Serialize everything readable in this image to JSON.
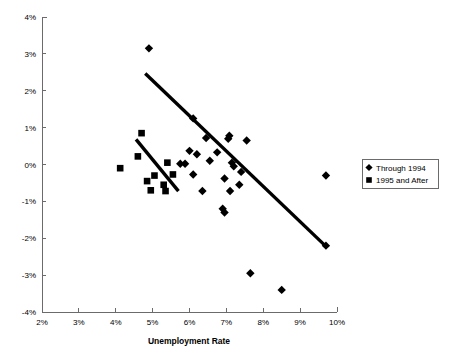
{
  "chart_data": {
    "type": "scatter",
    "title": "",
    "subtitle": "",
    "xlabel": "Unemployment Rate",
    "ylabel": "",
    "xlim": [
      2,
      10
    ],
    "ylim": [
      -4,
      4
    ],
    "xticks": [
      2,
      3,
      4,
      5,
      6,
      7,
      8,
      9,
      10
    ],
    "yticks": [
      -4,
      -3,
      -2,
      -1,
      0,
      1,
      2,
      3,
      4
    ],
    "xtick_labels": [
      "2%",
      "3%",
      "4%",
      "5%",
      "6%",
      "7%",
      "8%",
      "9%",
      "10%"
    ],
    "ytick_labels": [
      "-4%",
      "-3%",
      "-2%",
      "-1%",
      "0%",
      "1%",
      "2%",
      "3%",
      "4%"
    ],
    "grid": false,
    "legend_position": "right",
    "legend": [
      {
        "label": "Through 1994",
        "marker": "diamond",
        "color": "#000000"
      },
      {
        "label": "1995 and After",
        "marker": "square",
        "color": "#000000"
      }
    ],
    "series": [
      {
        "name": "Through 1994",
        "marker": "diamond",
        "color": "#000000",
        "points": [
          [
            4.9,
            3.15
          ],
          [
            6.1,
            1.25
          ],
          [
            6.45,
            0.72
          ],
          [
            6.0,
            0.37
          ],
          [
            6.2,
            0.28
          ],
          [
            5.75,
            0.02
          ],
          [
            5.88,
            0.02
          ],
          [
            6.75,
            0.33
          ],
          [
            6.55,
            0.1
          ],
          [
            6.1,
            -0.27
          ],
          [
            6.35,
            -0.72
          ],
          [
            7.05,
            0.7
          ],
          [
            7.08,
            0.78
          ],
          [
            7.55,
            0.65
          ],
          [
            7.15,
            0.05
          ],
          [
            7.2,
            -0.05
          ],
          [
            7.4,
            -0.2
          ],
          [
            6.95,
            -0.38
          ],
          [
            7.35,
            -0.55
          ],
          [
            7.1,
            -0.72
          ],
          [
            6.9,
            -1.2
          ],
          [
            6.95,
            -1.3
          ],
          [
            7.65,
            -2.95
          ],
          [
            8.5,
            -3.4
          ],
          [
            9.7,
            -0.3
          ],
          [
            9.7,
            -2.2
          ]
        ]
      },
      {
        "name": "1995 and After",
        "marker": "square",
        "color": "#000000",
        "points": [
          [
            4.7,
            0.85
          ],
          [
            4.12,
            -0.1
          ],
          [
            4.6,
            0.22
          ],
          [
            5.4,
            0.05
          ],
          [
            4.85,
            -0.45
          ],
          [
            5.05,
            -0.3
          ],
          [
            5.55,
            -0.27
          ],
          [
            5.3,
            -0.55
          ],
          [
            4.95,
            -0.7
          ],
          [
            5.35,
            -0.72
          ]
        ]
      }
    ],
    "trendlines": [
      {
        "name": "Through 1994 trend",
        "x1": 4.8,
        "y1": 2.47,
        "x2": 9.7,
        "y2": -2.22,
        "color": "#000000"
      },
      {
        "name": "1995 and After trend",
        "x1": 4.55,
        "y1": 0.68,
        "x2": 5.7,
        "y2": -0.72,
        "color": "#000000"
      }
    ]
  }
}
